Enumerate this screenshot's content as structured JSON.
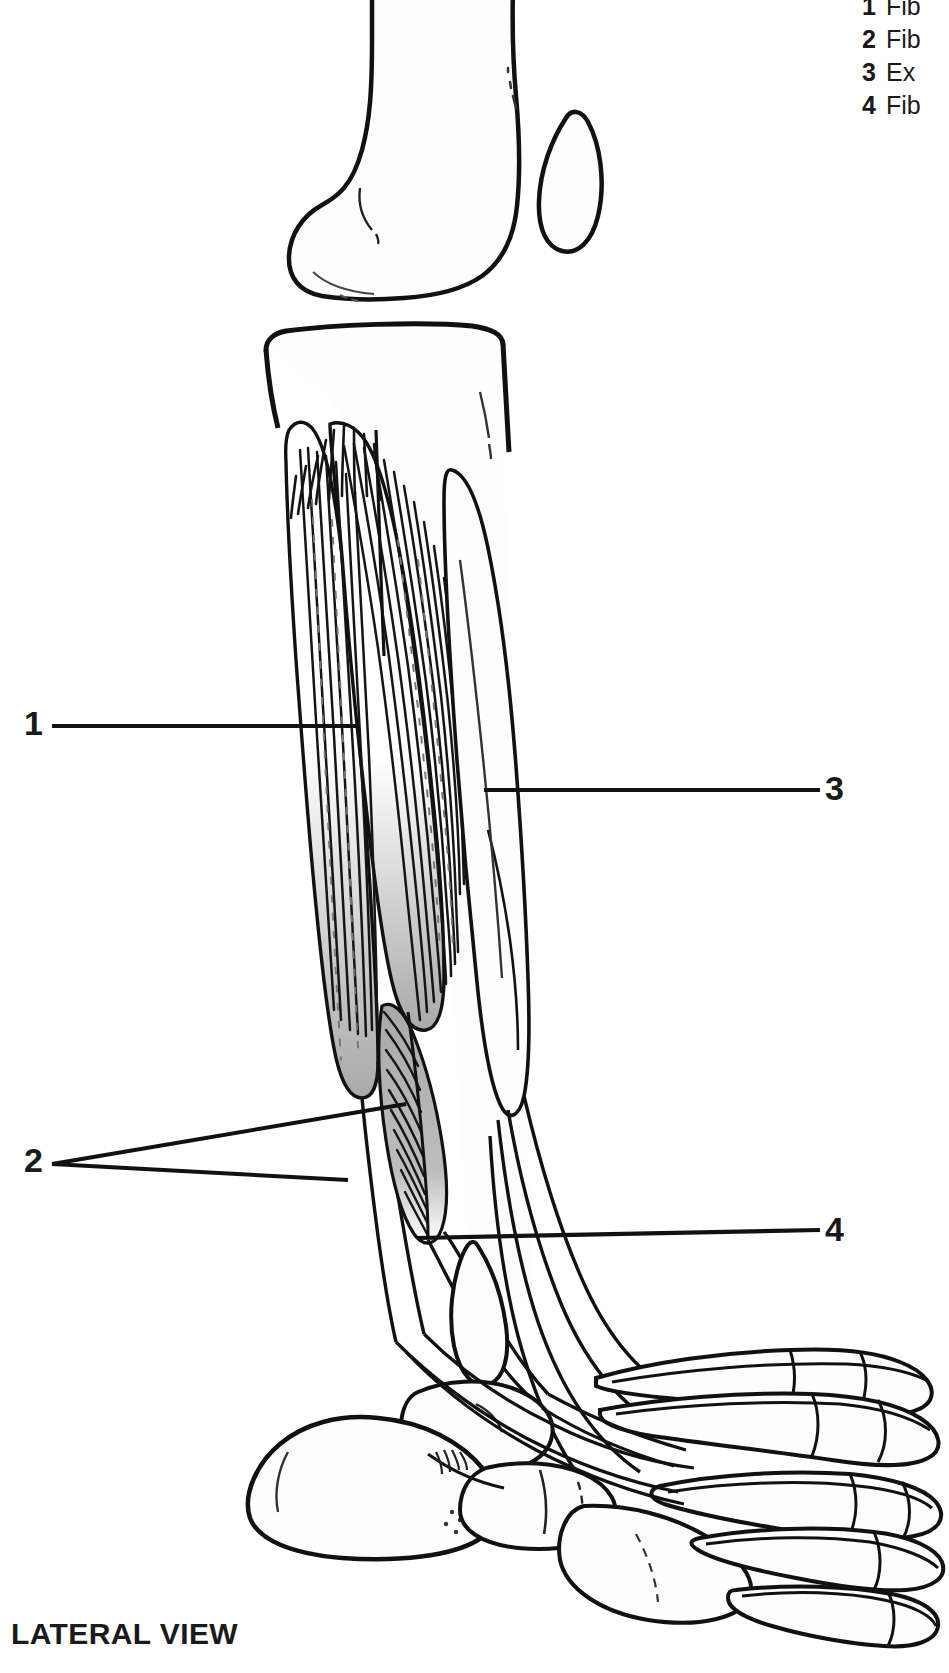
{
  "figure": {
    "view_label": "LATERAL VIEW",
    "muscle_fill_color": "#a9a9a9",
    "bone_fill_color": "#fdfdfd",
    "outline_color": "#111111"
  },
  "callouts": [
    {
      "number": "1"
    },
    {
      "number": "2"
    },
    {
      "number": "3"
    },
    {
      "number": "4"
    }
  ],
  "legend": {
    "items": [
      {
        "number": "1",
        "label": "Fib"
      },
      {
        "number": "2",
        "label": "Fib"
      },
      {
        "number": "3",
        "label": "Ex"
      },
      {
        "number": "4",
        "label": "Fib"
      }
    ]
  }
}
